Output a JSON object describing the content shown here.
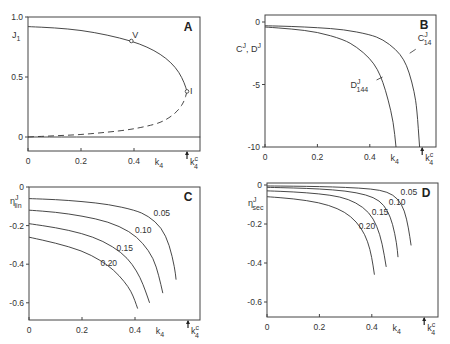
{
  "figure": {
    "panels": [
      "A",
      "B",
      "C",
      "D"
    ],
    "common_xlabel": "k4",
    "critical_marker_label": "k4^c",
    "critical_value": 0.6
  },
  "chart_data": [
    {
      "panel": "A",
      "type": "line",
      "title": "A",
      "xlabel": "k4",
      "ylabel": "J1",
      "xlim": [
        0,
        0.65
      ],
      "ylim": [
        -0.1,
        1.0
      ],
      "xticks": [
        "0",
        "0.2",
        "0.4"
      ],
      "yticks": [
        "0",
        "0.5",
        "1.0"
      ],
      "series": [
        {
          "name": "stable branch",
          "style": "solid",
          "x": [
            0,
            0.1,
            0.2,
            0.3,
            0.39,
            0.45,
            0.5,
            0.54,
            0.57,
            0.59,
            0.6
          ],
          "y": [
            0.92,
            0.91,
            0.89,
            0.85,
            0.8,
            0.75,
            0.69,
            0.62,
            0.54,
            0.45,
            0.38
          ]
        },
        {
          "name": "unstable branch",
          "style": "dashed",
          "x": [
            0.6,
            0.59,
            0.57,
            0.54,
            0.5,
            0.45,
            0.38,
            0.3,
            0.2,
            0.1,
            0
          ],
          "y": [
            0.38,
            0.3,
            0.23,
            0.17,
            0.12,
            0.09,
            0.06,
            0.04,
            0.02,
            0.01,
            0.0
          ]
        },
        {
          "name": "J1=0",
          "style": "solid",
          "x": [
            0,
            0.65
          ],
          "y": [
            0,
            0
          ]
        }
      ],
      "annotations": [
        {
          "text": "V",
          "x": 0.39,
          "y": 0.8
        },
        {
          "text": "I",
          "x": 0.6,
          "y": 0.38
        }
      ]
    },
    {
      "panel": "B",
      "type": "line",
      "title": "B",
      "xlabel": "k4",
      "ylabel": "C^J, D^J",
      "xlim": [
        0,
        0.65
      ],
      "ylim": [
        -10,
        0.5
      ],
      "xticks": [
        "0",
        "0.2",
        "0.4"
      ],
      "yticks": [
        "0",
        "-5",
        "-10"
      ],
      "series": [
        {
          "name": "C^J_14",
          "x": [
            0,
            0.1,
            0.2,
            0.3,
            0.4,
            0.45,
            0.5,
            0.53,
            0.55,
            0.57,
            0.58,
            0.59
          ],
          "y": [
            -0.3,
            -0.35,
            -0.45,
            -0.6,
            -1.0,
            -1.4,
            -2.2,
            -3.0,
            -4.0,
            -5.6,
            -7.0,
            -10
          ]
        },
        {
          "name": "D^J_144",
          "x": [
            0,
            0.1,
            0.2,
            0.3,
            0.35,
            0.4,
            0.43,
            0.45,
            0.47,
            0.49,
            0.5
          ],
          "y": [
            -0.4,
            -0.55,
            -0.8,
            -1.4,
            -2.0,
            -2.9,
            -3.8,
            -4.8,
            -6.2,
            -8.0,
            -10
          ]
        }
      ],
      "annotations": [
        {
          "text": "C^J_14",
          "x": 0.56,
          "y": -1.7
        },
        {
          "text": "D^J_144",
          "x": 0.38,
          "y": -4.8
        }
      ]
    },
    {
      "panel": "C",
      "type": "line",
      "title": "C",
      "xlabel": "k4",
      "ylabel": "eta^J_lin",
      "xlim": [
        0,
        0.65
      ],
      "ylim": [
        -0.7,
        0
      ],
      "xticks": [
        "0",
        "0.2",
        "0.4"
      ],
      "yticks": [
        "0",
        "-0.2",
        "-0.4",
        "-0.6"
      ],
      "series": [
        {
          "name": "0.05",
          "x": [
            0,
            0.1,
            0.2,
            0.3,
            0.4,
            0.45,
            0.5,
            0.53,
            0.55,
            0.555
          ],
          "y": [
            -0.06,
            -0.065,
            -0.075,
            -0.09,
            -0.12,
            -0.15,
            -0.21,
            -0.3,
            -0.42,
            -0.48
          ]
        },
        {
          "name": "0.10",
          "x": [
            0,
            0.1,
            0.2,
            0.3,
            0.38,
            0.43,
            0.47,
            0.49,
            0.505
          ],
          "y": [
            -0.12,
            -0.13,
            -0.15,
            -0.18,
            -0.23,
            -0.29,
            -0.37,
            -0.46,
            -0.55
          ]
        },
        {
          "name": "0.15",
          "x": [
            0,
            0.1,
            0.2,
            0.28,
            0.35,
            0.39,
            0.42,
            0.44,
            0.455
          ],
          "y": [
            -0.19,
            -0.21,
            -0.24,
            -0.28,
            -0.34,
            -0.4,
            -0.47,
            -0.54,
            -0.6
          ]
        },
        {
          "name": "0.20",
          "x": [
            0,
            0.1,
            0.2,
            0.27,
            0.32,
            0.36,
            0.385,
            0.4,
            0.41
          ],
          "y": [
            -0.26,
            -0.29,
            -0.33,
            -0.38,
            -0.43,
            -0.49,
            -0.54,
            -0.59,
            -0.63
          ]
        }
      ],
      "annotations": [
        {
          "text": "0.05",
          "x": 0.47,
          "y": -0.15
        },
        {
          "text": "0.10",
          "x": 0.4,
          "y": -0.24
        },
        {
          "text": "0.15",
          "x": 0.33,
          "y": -0.33
        },
        {
          "text": "0.20",
          "x": 0.27,
          "y": -0.41
        }
      ]
    },
    {
      "panel": "D",
      "type": "line",
      "title": "D",
      "xlabel": "k4",
      "ylabel": "eta^J_sec",
      "xlim": [
        0,
        0.65
      ],
      "ylim": [
        -0.68,
        0
      ],
      "xticks": [
        "0",
        "0.2",
        "0.4"
      ],
      "yticks": [
        "0",
        "-0.2",
        "-0.4",
        "-0.6"
      ],
      "series": [
        {
          "name": "0.05",
          "x": [
            0,
            0.1,
            0.2,
            0.3,
            0.4,
            0.46,
            0.5,
            0.525,
            0.54,
            0.55
          ],
          "y": [
            -0.005,
            -0.006,
            -0.008,
            -0.012,
            -0.02,
            -0.035,
            -0.07,
            -0.13,
            -0.22,
            -0.31
          ]
        },
        {
          "name": "0.10",
          "x": [
            0,
            0.1,
            0.2,
            0.3,
            0.38,
            0.43,
            0.46,
            0.48,
            0.495,
            0.5
          ],
          "y": [
            -0.012,
            -0.015,
            -0.02,
            -0.03,
            -0.05,
            -0.08,
            -0.13,
            -0.2,
            -0.3,
            -0.37
          ]
        },
        {
          "name": "0.15",
          "x": [
            0,
            0.1,
            0.2,
            0.28,
            0.34,
            0.39,
            0.42,
            0.44,
            0.455
          ],
          "y": [
            -0.03,
            -0.035,
            -0.045,
            -0.06,
            -0.09,
            -0.14,
            -0.21,
            -0.3,
            -0.42
          ]
        },
        {
          "name": "0.20",
          "x": [
            0,
            0.1,
            0.2,
            0.27,
            0.32,
            0.36,
            0.385,
            0.4,
            0.41
          ],
          "y": [
            -0.06,
            -0.07,
            -0.09,
            -0.12,
            -0.16,
            -0.22,
            -0.29,
            -0.37,
            -0.46
          ]
        }
      ],
      "annotations": [
        {
          "text": "0.05",
          "x": 0.51,
          "y": -0.05
        },
        {
          "text": "0.10",
          "x": 0.465,
          "y": -0.1
        },
        {
          "text": "0.15",
          "x": 0.4,
          "y": -0.155
        },
        {
          "text": "0.20",
          "x": 0.35,
          "y": -0.225
        }
      ]
    }
  ]
}
